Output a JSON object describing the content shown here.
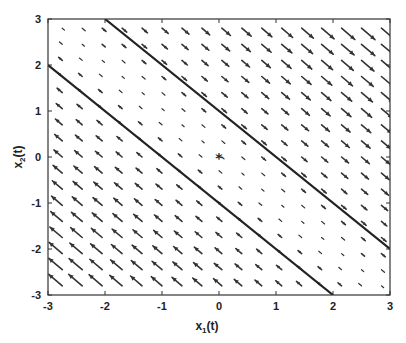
{
  "chart_data": {
    "type": "quiver",
    "title": "",
    "xlabel": "x_1(t)",
    "ylabel": "x_2(t)",
    "xlim": [
      -3,
      3
    ],
    "ylim": [
      -3,
      3
    ],
    "xticks": [
      -3,
      -2,
      -1,
      0,
      1,
      2,
      3
    ],
    "yticks": [
      -3,
      -2,
      -1,
      0,
      1,
      2,
      3
    ],
    "grid": false,
    "legend": null,
    "vector_field": {
      "description": "Arrows point along direction (1,-1) with magnitude proportional to (x1 + x2); arrows point down-right above the band and up-left below it",
      "grid_x_start": -2.75,
      "grid_x_step": 0.35,
      "grid_y_start": -2.8,
      "grid_y_step": 0.35,
      "count_x": 17,
      "count_y": 17
    },
    "lines": [
      {
        "name": "upper-boundary",
        "equation": "x1 + x2 = 1",
        "points": [
          [
            -2,
            3
          ],
          [
            3,
            -2
          ]
        ]
      },
      {
        "name": "lower-boundary",
        "equation": "x1 + x2 = -1",
        "points": [
          [
            -3,
            2
          ],
          [
            2,
            -3
          ]
        ]
      }
    ],
    "markers": [
      {
        "name": "equilibrium-point",
        "symbol": "*",
        "x": 0,
        "y": 0
      }
    ]
  },
  "labels": {
    "xlabel_main": "x",
    "xlabel_sub": "1",
    "xlabel_tail": "(t)",
    "ylabel_main": "x",
    "ylabel_sub": "2",
    "ylabel_tail": "(t)"
  }
}
